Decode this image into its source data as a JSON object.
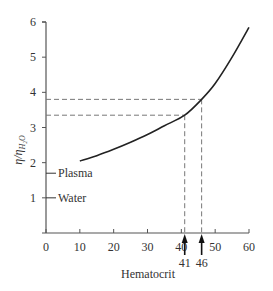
{
  "chart_data": {
    "type": "line",
    "title": "",
    "xlabel": "Hematocrit",
    "ylabel": "η/η_H2O",
    "xlim": [
      0,
      60
    ],
    "ylim": [
      0,
      6
    ],
    "xticks": [
      0,
      10,
      20,
      30,
      40,
      50,
      60
    ],
    "yticks": [
      0,
      1,
      2,
      3,
      4,
      5,
      6
    ],
    "ytick_labels": [
      "",
      "1",
      "2",
      "3",
      "4",
      "5",
      "6"
    ],
    "grid": false,
    "series": [
      {
        "name": "Relative viscosity of blood",
        "x": [
          10,
          15,
          20,
          25,
          30,
          35,
          41,
          46,
          50,
          55,
          60
        ],
        "y": [
          2.05,
          2.2,
          2.38,
          2.58,
          2.8,
          3.05,
          3.35,
          3.8,
          4.25,
          5.0,
          5.85
        ]
      }
    ],
    "reference_levels": [
      {
        "label": "Plasma",
        "y": 1.7
      },
      {
        "label": "Water",
        "y": 1.0
      }
    ],
    "annotations": [
      {
        "type": "arrow",
        "x": 41,
        "label": "41",
        "y_at_curve": 3.35
      },
      {
        "type": "arrow",
        "x": 46,
        "label": "46",
        "y_at_curve": 3.8
      }
    ]
  },
  "labels": {
    "ylabel_main": "η/η",
    "ylabel_sub": "H₂O",
    "xlabel": "Hematocrit",
    "plasma": "Plasma",
    "water": "Water",
    "arrow41": "41",
    "arrow46": "46"
  }
}
